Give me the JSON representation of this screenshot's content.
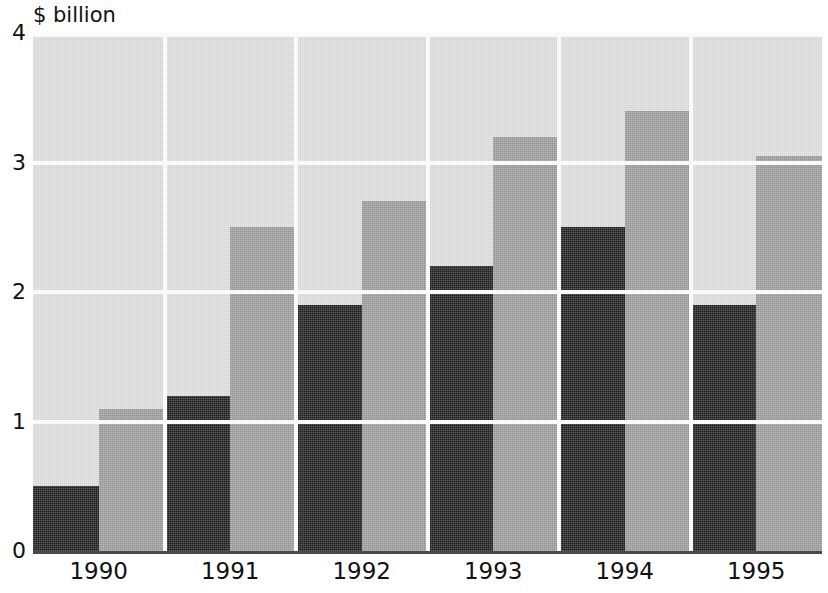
{
  "chart_data": {
    "type": "bar",
    "title": "",
    "subtitle": "",
    "xlabel": "",
    "ylabel": "$ billion",
    "unit_label": "$ billion",
    "categories": [
      "1990",
      "1991",
      "1992",
      "1993",
      "1994",
      "1995"
    ],
    "series": [
      {
        "name": "series-a",
        "color": "#1d1d1d",
        "values": [
          0.5,
          1.2,
          1.9,
          2.2,
          2.5,
          1.9
        ]
      },
      {
        "name": "series-b",
        "color": "#9a9a9a",
        "values": [
          1.1,
          2.5,
          2.7,
          3.2,
          3.4,
          3.05
        ]
      }
    ],
    "ylim": [
      0,
      4
    ],
    "yticks": [
      0,
      1,
      2,
      3,
      4
    ],
    "ytick_labels": [
      "0",
      "1",
      "2",
      "3",
      "4"
    ],
    "grid": true,
    "grid_axis": "y",
    "gridline_color": "#ffffff",
    "plot_background": "#dddddd",
    "legend": false,
    "legend_position": "none",
    "bar_group_mode": "grouped"
  },
  "axes": {
    "y_unit": "$ billion",
    "y_tick_values": [
      "4",
      "3",
      "2",
      "1",
      "0"
    ],
    "x_tick_values": [
      "1990",
      "1991",
      "1992",
      "1993",
      "1994",
      "1995"
    ]
  },
  "colors": {
    "series_a": "#1d1d1d",
    "series_b": "#9a9a9a",
    "plot_bg": "#dddddd",
    "gridline": "#ffffff",
    "axis_line": "#4a4a4a",
    "text": "#111111",
    "page_bg": "#ffffff"
  }
}
